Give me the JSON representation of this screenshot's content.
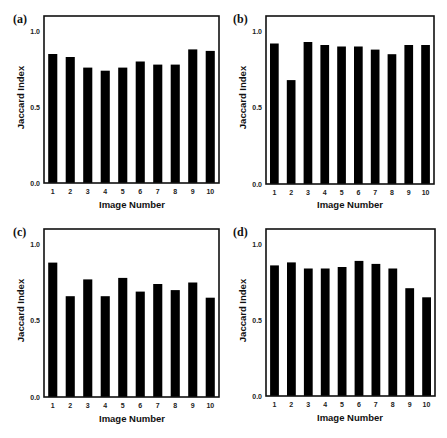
{
  "figure": {
    "panels": [
      {
        "id": "a",
        "label": "(a)",
        "ylabel": "Jaccard Index",
        "xlabel": "Image Number"
      },
      {
        "id": "b",
        "label": "(b)",
        "ylabel": "Jaccard Index",
        "xlabel": "Image Number"
      },
      {
        "id": "c",
        "label": "(c)",
        "ylabel": "Jaccard Index",
        "xlabel": "Image Number"
      },
      {
        "id": "d",
        "label": "(d)",
        "ylabel": "Jaccard Index",
        "xlabel": "Image Number"
      }
    ]
  },
  "colors": {
    "bar": "#000000",
    "axis": "#111111",
    "background": "#ffffff"
  },
  "chart_data": [
    {
      "type": "bar",
      "panel": "(a)",
      "title": "",
      "xlabel": "Image Number",
      "ylabel": "Jaccard Index",
      "categories": [
        "1",
        "2",
        "3",
        "4",
        "5",
        "6",
        "7",
        "8",
        "9",
        "10"
      ],
      "values": [
        0.85,
        0.83,
        0.76,
        0.74,
        0.76,
        0.8,
        0.78,
        0.78,
        0.88,
        0.87
      ],
      "ylim": [
        0.0,
        1.1
      ],
      "yticks": [
        "0.0",
        "0.5",
        "1.0"
      ],
      "grid": false,
      "legend": null
    },
    {
      "type": "bar",
      "panel": "(b)",
      "title": "",
      "xlabel": "Image Number",
      "ylabel": "Jaccard Index",
      "categories": [
        "1",
        "2",
        "3",
        "4",
        "5",
        "6",
        "7",
        "8",
        "9",
        "10"
      ],
      "values": [
        0.92,
        0.68,
        0.93,
        0.91,
        0.9,
        0.9,
        0.88,
        0.85,
        0.91,
        0.91
      ],
      "ylim": [
        0.0,
        1.1
      ],
      "yticks": [
        "0.0",
        "0.5",
        "1.0"
      ],
      "grid": false,
      "legend": null
    },
    {
      "type": "bar",
      "panel": "(c)",
      "title": "",
      "xlabel": "Image Number",
      "ylabel": "Jaccard Index",
      "categories": [
        "1",
        "2",
        "3",
        "4",
        "5",
        "6",
        "7",
        "8",
        "9",
        "10"
      ],
      "values": [
        0.88,
        0.66,
        0.77,
        0.66,
        0.78,
        0.69,
        0.74,
        0.7,
        0.75,
        0.65
      ],
      "ylim": [
        0.0,
        1.1
      ],
      "yticks": [
        "0.0",
        "0.5",
        "1.0"
      ],
      "grid": false,
      "legend": null
    },
    {
      "type": "bar",
      "panel": "(d)",
      "title": "",
      "xlabel": "Image Number",
      "ylabel": "Jaccard Index",
      "categories": [
        "1",
        "2",
        "3",
        "4",
        "5",
        "6",
        "7",
        "8",
        "9",
        "10"
      ],
      "values": [
        0.86,
        0.88,
        0.84,
        0.84,
        0.85,
        0.89,
        0.87,
        0.84,
        0.71,
        0.65
      ],
      "ylim": [
        0.0,
        1.1
      ],
      "yticks": [
        "0.0",
        "0.5",
        "1.0"
      ],
      "grid": false,
      "legend": null
    }
  ]
}
